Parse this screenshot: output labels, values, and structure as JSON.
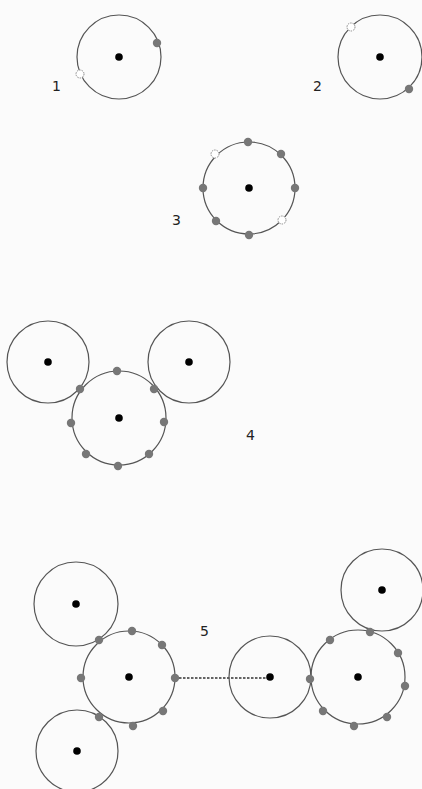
{
  "colors": {
    "background": "#fbfbfb",
    "ring": "#555555",
    "nucleus": "#000000",
    "filled_site": "#777777",
    "open_site": "#ffffff"
  },
  "figures": [
    {
      "label": "1",
      "label_pos": [
        52,
        91
      ],
      "circles": [
        {
          "cx": 119,
          "cy": 57,
          "r": 42,
          "nucleus": true
        }
      ],
      "sites": [
        {
          "x": 157,
          "y": 43,
          "type": "filled"
        },
        {
          "x": 80,
          "y": 74,
          "type": "open"
        }
      ],
      "links": []
    },
    {
      "label": "2",
      "label_pos": [
        313,
        91
      ],
      "circles": [
        {
          "cx": 380,
          "cy": 57,
          "r": 42,
          "nucleus": true
        }
      ],
      "sites": [
        {
          "x": 351,
          "y": 27,
          "type": "open"
        },
        {
          "x": 409,
          "y": 89,
          "type": "filled"
        }
      ],
      "links": []
    },
    {
      "label": "3",
      "label_pos": [
        172,
        225
      ],
      "circles": [
        {
          "cx": 249,
          "cy": 188,
          "r": 46,
          "nucleus": true
        }
      ],
      "sites": [
        {
          "x": 248,
          "y": 142,
          "type": "filled"
        },
        {
          "x": 281,
          "y": 154,
          "type": "filled"
        },
        {
          "x": 295,
          "y": 188,
          "type": "filled"
        },
        {
          "x": 282,
          "y": 220,
          "type": "open"
        },
        {
          "x": 249,
          "y": 235,
          "type": "filled"
        },
        {
          "x": 216,
          "y": 221,
          "type": "filled"
        },
        {
          "x": 203,
          "y": 188,
          "type": "filled"
        },
        {
          "x": 215,
          "y": 154,
          "type": "open"
        }
      ],
      "links": []
    },
    {
      "label": "4",
      "label_pos": [
        246,
        440
      ],
      "circles": [
        {
          "cx": 119,
          "cy": 418,
          "r": 47,
          "nucleus": true
        },
        {
          "cx": 48,
          "cy": 362,
          "r": 41,
          "nucleus": true
        },
        {
          "cx": 189,
          "cy": 362,
          "r": 41,
          "nucleus": true
        }
      ],
      "sites": [
        {
          "x": 117,
          "y": 371,
          "type": "filled"
        },
        {
          "x": 154,
          "y": 389,
          "type": "filled"
        },
        {
          "x": 164,
          "y": 422,
          "type": "filled"
        },
        {
          "x": 149,
          "y": 454,
          "type": "filled"
        },
        {
          "x": 118,
          "y": 466,
          "type": "filled"
        },
        {
          "x": 86,
          "y": 454,
          "type": "filled"
        },
        {
          "x": 71,
          "y": 423,
          "type": "filled"
        },
        {
          "x": 80,
          "y": 389,
          "type": "filled"
        }
      ],
      "links": []
    },
    {
      "label": "5",
      "label_pos": [
        200,
        636
      ],
      "circles": [
        {
          "cx": 129,
          "cy": 677,
          "r": 46,
          "nucleus": true
        },
        {
          "cx": 76,
          "cy": 604,
          "r": 42,
          "nucleus": true
        },
        {
          "cx": 77,
          "cy": 751,
          "r": 41,
          "nucleus": true
        },
        {
          "cx": 270,
          "cy": 677,
          "r": 41,
          "nucleus": true
        },
        {
          "cx": 358,
          "cy": 677,
          "r": 47,
          "nucleus": true
        },
        {
          "cx": 382,
          "cy": 590,
          "r": 41,
          "nucleus": true
        }
      ],
      "sites": [
        {
          "x": 132,
          "y": 631,
          "type": "filled"
        },
        {
          "x": 162,
          "y": 645,
          "type": "filled"
        },
        {
          "x": 175,
          "y": 678,
          "type": "filled"
        },
        {
          "x": 163,
          "y": 711,
          "type": "filled"
        },
        {
          "x": 133,
          "y": 726,
          "type": "filled"
        },
        {
          "x": 99,
          "y": 717,
          "type": "filled"
        },
        {
          "x": 81,
          "y": 678,
          "type": "filled"
        },
        {
          "x": 99,
          "y": 640,
          "type": "filled"
        },
        {
          "x": 310,
          "y": 679,
          "type": "filled"
        },
        {
          "x": 330,
          "y": 640,
          "type": "filled"
        },
        {
          "x": 370,
          "y": 632,
          "type": "filled"
        },
        {
          "x": 398,
          "y": 653,
          "type": "filled"
        },
        {
          "x": 405,
          "y": 686,
          "type": "filled"
        },
        {
          "x": 387,
          "y": 717,
          "type": "filled"
        },
        {
          "x": 354,
          "y": 726,
          "type": "filled"
        },
        {
          "x": 323,
          "y": 711,
          "type": "filled"
        }
      ],
      "links": [
        {
          "x1": 175,
          "y1": 678,
          "x2": 270,
          "y2": 678,
          "style": "dashed"
        }
      ]
    }
  ]
}
